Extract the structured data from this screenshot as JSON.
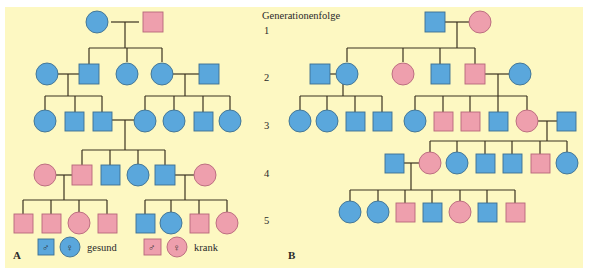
{
  "colors": {
    "background": "#fdf8c2",
    "healthy": "#5aa7dc",
    "sick": "#ee9fad",
    "stroke_healthy": "#3d6f90",
    "stroke_sick": "#b5677a",
    "line": "#3b3320"
  },
  "generation_axis": {
    "title": "Generationenfolge",
    "labels": [
      "1",
      "2",
      "3",
      "4",
      "5"
    ]
  },
  "panels": {
    "A": {
      "label": "A"
    },
    "B": {
      "label": "B"
    }
  },
  "legend": {
    "male_symbol": "♂",
    "female_symbol": "♀",
    "healthy_label": "gesund",
    "sick_label": "krank"
  },
  "pedigree_A": {
    "generations": [
      {
        "gen": 1,
        "members": [
          {
            "sex": "female",
            "status": "healthy"
          },
          {
            "sex": "male",
            "status": "sick"
          }
        ]
      },
      {
        "gen": 2,
        "members": [
          {
            "sex": "female",
            "status": "healthy",
            "note": "married-in"
          },
          {
            "sex": "male",
            "status": "healthy"
          },
          {
            "sex": "female",
            "status": "healthy"
          },
          {
            "sex": "female",
            "status": "healthy"
          },
          {
            "sex": "male",
            "status": "healthy",
            "note": "married-in"
          }
        ]
      },
      {
        "gen": 3,
        "members": [
          {
            "sex": "female",
            "status": "healthy"
          },
          {
            "sex": "male",
            "status": "healthy"
          },
          {
            "sex": "male",
            "status": "healthy"
          },
          {
            "sex": "female",
            "status": "healthy"
          },
          {
            "sex": "female",
            "status": "healthy"
          },
          {
            "sex": "male",
            "status": "healthy"
          },
          {
            "sex": "female",
            "status": "healthy"
          }
        ]
      },
      {
        "gen": 4,
        "members": [
          {
            "sex": "female",
            "status": "sick",
            "note": "married-in"
          },
          {
            "sex": "male",
            "status": "sick"
          },
          {
            "sex": "male",
            "status": "healthy"
          },
          {
            "sex": "female",
            "status": "healthy"
          },
          {
            "sex": "male",
            "status": "healthy"
          },
          {
            "sex": "female",
            "status": "sick",
            "note": "married-in"
          }
        ]
      },
      {
        "gen": 5,
        "members": [
          {
            "sex": "male",
            "status": "sick"
          },
          {
            "sex": "male",
            "status": "sick"
          },
          {
            "sex": "female",
            "status": "sick"
          },
          {
            "sex": "male",
            "status": "sick"
          },
          {
            "sex": "male",
            "status": "healthy"
          },
          {
            "sex": "female",
            "status": "healthy"
          },
          {
            "sex": "male",
            "status": "sick"
          },
          {
            "sex": "female",
            "status": "sick"
          }
        ]
      }
    ]
  },
  "pedigree_B": {
    "generations": [
      {
        "gen": 1,
        "members": [
          {
            "sex": "male",
            "status": "healthy"
          },
          {
            "sex": "female",
            "status": "sick"
          }
        ]
      },
      {
        "gen": 2,
        "members": [
          {
            "sex": "male",
            "status": "healthy",
            "note": "married-in"
          },
          {
            "sex": "female",
            "status": "healthy"
          },
          {
            "sex": "female",
            "status": "sick"
          },
          {
            "sex": "male",
            "status": "healthy"
          },
          {
            "sex": "male",
            "status": "sick"
          },
          {
            "sex": "female",
            "status": "healthy",
            "note": "married-in"
          }
        ]
      },
      {
        "gen": 3,
        "members": [
          {
            "sex": "female",
            "status": "healthy"
          },
          {
            "sex": "female",
            "status": "healthy"
          },
          {
            "sex": "male",
            "status": "healthy"
          },
          {
            "sex": "male",
            "status": "healthy"
          },
          {
            "sex": "female",
            "status": "healthy"
          },
          {
            "sex": "male",
            "status": "sick"
          },
          {
            "sex": "male",
            "status": "sick"
          },
          {
            "sex": "male",
            "status": "healthy"
          },
          {
            "sex": "female",
            "status": "sick"
          },
          {
            "sex": "male",
            "status": "healthy",
            "note": "married-in"
          }
        ]
      },
      {
        "gen": 4,
        "members": [
          {
            "sex": "male",
            "status": "healthy",
            "note": "married-in"
          },
          {
            "sex": "female",
            "status": "sick"
          },
          {
            "sex": "female",
            "status": "healthy"
          },
          {
            "sex": "male",
            "status": "healthy"
          },
          {
            "sex": "male",
            "status": "healthy"
          },
          {
            "sex": "male",
            "status": "sick"
          },
          {
            "sex": "female",
            "status": "healthy"
          }
        ]
      },
      {
        "gen": 5,
        "members": [
          {
            "sex": "female",
            "status": "healthy"
          },
          {
            "sex": "female",
            "status": "healthy"
          },
          {
            "sex": "male",
            "status": "sick"
          },
          {
            "sex": "male",
            "status": "healthy"
          },
          {
            "sex": "female",
            "status": "sick"
          },
          {
            "sex": "male",
            "status": "healthy"
          },
          {
            "sex": "male",
            "status": "sick"
          }
        ]
      }
    ]
  }
}
